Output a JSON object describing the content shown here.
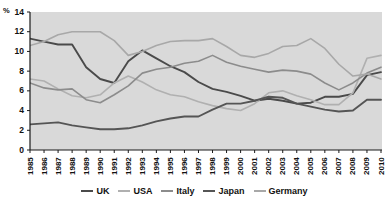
{
  "chart_data": {
    "type": "line",
    "title": "",
    "subtitle": "",
    "xlabel": "",
    "ylabel": "%",
    "unit_label": "%",
    "xlim": [
      1985,
      2010
    ],
    "ylim": [
      0,
      14
    ],
    "ytick_step": 2,
    "grid": false,
    "legend_position": "bottom",
    "categories": [
      1985,
      1986,
      1987,
      1988,
      1989,
      1990,
      1991,
      1992,
      1993,
      1994,
      1995,
      1996,
      1997,
      1998,
      1999,
      2000,
      2001,
      2002,
      2003,
      2004,
      2005,
      2006,
      2007,
      2008,
      2009,
      2010
    ],
    "xtick_labels": [
      "1985",
      "1986",
      "1987",
      "1988",
      "1989",
      "1990",
      "1991",
      "1992",
      "1993",
      "1994",
      "1995",
      "1996",
      "1997",
      "1998",
      "1999",
      "2000",
      "2001",
      "2002",
      "2003",
      "2004",
      "2005",
      "2006",
      "2007",
      "2008",
      "2009",
      "2010"
    ],
    "ytick_labels": [
      "0",
      "2",
      "4",
      "6",
      "8",
      "10",
      "12",
      "14"
    ],
    "ytick_values": [
      0,
      2,
      4,
      6,
      8,
      10,
      12,
      14
    ],
    "series": [
      {
        "name": "UK",
        "color": "#4a4a4a",
        "width": 1.9,
        "values": [
          11.3,
          11.0,
          10.7,
          10.7,
          8.4,
          7.2,
          6.8,
          9.0,
          10.1,
          9.3,
          8.5,
          7.9,
          6.9,
          6.2,
          5.9,
          5.5,
          5.0,
          5.2,
          5.0,
          4.7,
          4.8,
          5.4,
          5.4,
          5.7,
          7.6,
          7.9
        ]
      },
      {
        "name": "USA",
        "color": "#b0b0b0",
        "width": 1.6,
        "values": [
          7.2,
          7.0,
          6.2,
          5.5,
          5.3,
          5.6,
          6.8,
          7.5,
          6.9,
          6.1,
          5.6,
          5.4,
          4.9,
          4.5,
          4.2,
          4.0,
          4.7,
          5.8,
          6.0,
          5.5,
          5.1,
          4.6,
          4.6,
          5.8,
          9.3,
          9.6
        ]
      },
      {
        "name": "Italy",
        "color": "#8c8c8c",
        "width": 1.6,
        "values": [
          6.8,
          6.3,
          6.1,
          6.2,
          5.1,
          4.8,
          5.6,
          6.5,
          7.8,
          8.2,
          8.4,
          8.8,
          9.0,
          9.6,
          8.9,
          8.5,
          8.2,
          7.9,
          8.1,
          8.0,
          7.7,
          6.8,
          6.1,
          6.8,
          7.8,
          8.4
        ]
      },
      {
        "name": "Japan",
        "color": "#555555",
        "width": 1.9,
        "values": [
          2.6,
          2.7,
          2.8,
          2.5,
          2.3,
          2.1,
          2.1,
          2.2,
          2.5,
          2.9,
          3.2,
          3.4,
          3.4,
          4.1,
          4.7,
          4.7,
          5.0,
          5.4,
          5.3,
          4.7,
          4.4,
          4.1,
          3.9,
          4.0,
          5.1,
          5.1
        ]
      },
      {
        "name": "Germany",
        "color": "#a8a8a8",
        "width": 1.6,
        "values": [
          10.6,
          11.0,
          11.7,
          12.0,
          12.0,
          12.0,
          11.1,
          9.6,
          10.0,
          10.6,
          11.0,
          11.1,
          11.1,
          11.3,
          10.5,
          9.6,
          9.4,
          9.8,
          10.5,
          10.6,
          11.3,
          10.3,
          8.7,
          7.5,
          7.7,
          7.2
        ]
      }
    ],
    "legend_entries": [
      {
        "label": "UK",
        "color": "#4a4a4a"
      },
      {
        "label": "USA",
        "color": "#b0b0b0"
      },
      {
        "label": "Italy",
        "color": "#8c8c8c"
      },
      {
        "label": "Japan",
        "color": "#555555"
      },
      {
        "label": "Germany",
        "color": "#a8a8a8"
      }
    ],
    "plot_background": "#d9d9d9",
    "axis_color": "#1a1a1a"
  }
}
